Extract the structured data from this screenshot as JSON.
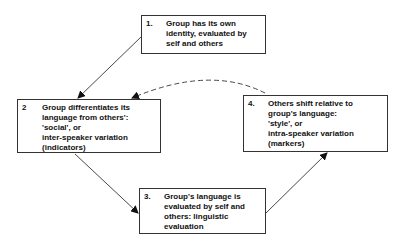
{
  "diagram": {
    "nodes": [
      {
        "id": "n1",
        "number": "1.",
        "lines": [
          "Group has its own",
          "identity, evaluated by",
          "self and others"
        ]
      },
      {
        "id": "n2",
        "number": "2",
        "lines": [
          "Group differentiates its",
          "language from others':",
          "'social', or",
          "inter-speaker variation",
          "(indicators)"
        ]
      },
      {
        "id": "n3",
        "number": "3.",
        "lines": [
          "Group's language is",
          "evaluated by self and",
          "others: linguistic",
          "evaluation"
        ]
      },
      {
        "id": "n4",
        "number": "4.",
        "lines": [
          "Others shift relative to",
          "group's language:",
          "'style', or",
          "intra-speaker variation",
          "(markers)"
        ]
      }
    ],
    "edges": [
      {
        "from": "n1",
        "to": "n2",
        "style": "solid"
      },
      {
        "from": "n2",
        "to": "n3",
        "style": "solid"
      },
      {
        "from": "n3",
        "to": "n4",
        "style": "solid"
      },
      {
        "from": "n4",
        "to": "n2",
        "style": "dashed"
      }
    ]
  }
}
